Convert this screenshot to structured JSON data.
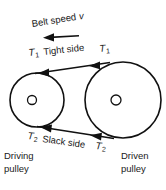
{
  "figure": {
    "background_color": "#ffffff",
    "stroke_color": "#111111",
    "text_color": "#1a1a1a"
  },
  "labels": {
    "belt_speed": "Belt speed",
    "belt_speed_symbol": "v",
    "tight_side": "Tight side",
    "slack_side": "Slack side",
    "tension_tight": "T",
    "tension_tight_sub": "1",
    "tension_slack": "T",
    "tension_slack_sub": "2",
    "driving_pulley_line1": "Driving",
    "driving_pulley_line2": "pulley",
    "driven_pulley_line1": "Driven",
    "driven_pulley_line2": "pulley"
  },
  "geometry": {
    "driving_pulley": {
      "cx": 37,
      "cy": 100,
      "r": 27,
      "hub_cx": 32,
      "hub_cy": 100,
      "hub_r": 4.5
    },
    "driven_pulley": {
      "cx": 123,
      "cy": 100,
      "r": 38,
      "hub_cx": 116,
      "hub_cy": 100,
      "hub_r": 5
    },
    "tight_side_belt": {
      "x1": 36,
      "y1": 73,
      "x2": 108,
      "y2": 62
    },
    "slack_side_belt": {
      "x1": 38,
      "y1": 127,
      "x2": 112,
      "y2": 138
    },
    "speed_arrow": {
      "x1": 79,
      "y1": 36,
      "x2": 44,
      "y2": 38
    }
  },
  "arrow_directions": {
    "belt_speed": "left",
    "tight_side": "left",
    "slack_side": "left"
  }
}
